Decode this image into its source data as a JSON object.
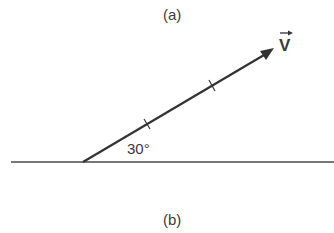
{
  "diagram": {
    "panel_top_label": "(a)",
    "panel_bottom_label": "(b)",
    "angle_label": "30°",
    "vector_label": "V",
    "vector_symbol": "vector-arrow-over-V",
    "angle_degrees": 30,
    "colors": {
      "line": "#3a3a3a",
      "text": "#3a3a3a",
      "background": "#ffffff"
    }
  }
}
